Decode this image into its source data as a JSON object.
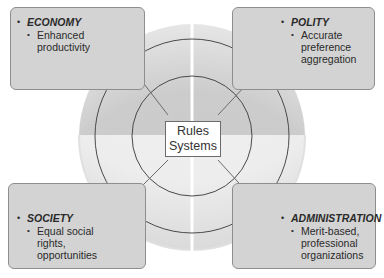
{
  "diagram": {
    "center": {
      "line1": "Rules",
      "line2": "Systems"
    },
    "quadrants": [
      {
        "id": "economy",
        "title": "ECONOMY",
        "items": [
          "Enhanced productivity"
        ],
        "lines": [
          "Enhanced",
          "productivity"
        ]
      },
      {
        "id": "polity",
        "title": "POLITY",
        "items": [
          "Accurate preference aggregation"
        ],
        "lines": [
          "Accurate",
          "preference",
          "aggregation"
        ]
      },
      {
        "id": "society",
        "title": "SOCIETY",
        "items": [
          "Equal social rights, opportunities"
        ],
        "lines": [
          "Equal social",
          "rights,",
          "opportunities"
        ]
      },
      {
        "id": "administration",
        "title": "ADMINISTRATION",
        "items": [
          "Merit-based, professional organizations"
        ],
        "lines": [
          "Merit-based,",
          "professional",
          "organizations"
        ]
      }
    ],
    "colors": {
      "box_fill": "#d3d3d3",
      "box_border": "#8e8e8e",
      "ring_top": "#cfcfcf",
      "ring_bottom": "#ececec",
      "ring_lines": "#4a4a4a",
      "arrows": "#6b6b6b"
    }
  }
}
